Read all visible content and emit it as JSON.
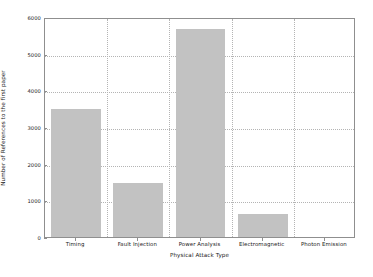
{
  "chart_data": {
    "type": "bar",
    "title": "",
    "xlabel": "Physical Attack Type",
    "ylabel": "Number of References to the first paper",
    "categories": [
      "Timing",
      "Fault Injection",
      "Power Analysis",
      "Electromagnetic",
      "Photon Emission"
    ],
    "values": [
      3500,
      1480,
      5680,
      620,
      0
    ],
    "ylim": [
      0,
      6000
    ],
    "yticks": [
      0,
      1000,
      2000,
      3000,
      4000,
      5000,
      6000
    ],
    "ytick_labels": [
      "0",
      "1000",
      "2000",
      "3000",
      "4000",
      "5000",
      "6000"
    ],
    "grid": true,
    "grid_style": "dotted",
    "legend": null,
    "bar_color": "#c2c2c2",
    "axis_color": "#8f8f8f",
    "background_color": "#ffffff"
  }
}
